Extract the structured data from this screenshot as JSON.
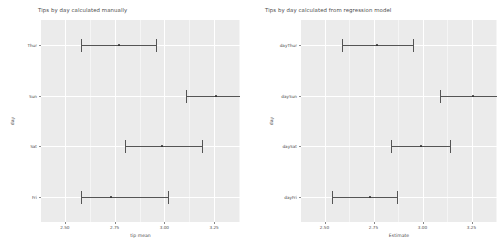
{
  "chart_data": [
    {
      "type": "scatter",
      "id": "manual",
      "title": "Tips by day calculated manually",
      "xlabel": "tip mean",
      "ylabel": "day",
      "grid": true,
      "legend": false,
      "xlim": [
        2.38,
        3.38
      ],
      "xticks": [
        2.5,
        2.75,
        3.0,
        3.25
      ],
      "xticklabels": [
        "2.50",
        "2.75",
        "3.00",
        "3.25"
      ],
      "categories": [
        "Thur",
        "Sun",
        "Sat",
        "Fri"
      ],
      "points": [
        {
          "category": "Thur",
          "estimate": 2.77,
          "low": 2.58,
          "high": 2.96
        },
        {
          "category": "Sun",
          "estimate": 3.26,
          "low": 3.11,
          "high": 3.41
        },
        {
          "category": "Sat",
          "estimate": 2.99,
          "low": 2.8,
          "high": 3.19
        },
        {
          "category": "Fri",
          "estimate": 2.73,
          "low": 2.58,
          "high": 3.02
        }
      ]
    },
    {
      "type": "scatter",
      "id": "regression",
      "title": "Tips by day calculated from regression model",
      "xlabel": "Estimate",
      "ylabel": "day",
      "grid": true,
      "legend": false,
      "xlim": [
        2.38,
        3.38
      ],
      "xticks": [
        2.5,
        2.75,
        3.0,
        3.25,
        3.5
      ],
      "xticklabels": [
        "2.50",
        "2.75",
        "3.00",
        "3.25",
        "3.50"
      ],
      "categories": [
        "dayThur",
        "daySun",
        "daySat",
        "dayFri"
      ],
      "points": [
        {
          "category": "dayThur",
          "estimate": 2.77,
          "low": 2.59,
          "high": 2.95
        },
        {
          "category": "daySun",
          "estimate": 3.26,
          "low": 3.09,
          "high": 3.43
        },
        {
          "category": "daySat",
          "estimate": 2.99,
          "low": 2.84,
          "high": 3.14
        },
        {
          "category": "dayFri",
          "estimate": 2.73,
          "low": 2.54,
          "high": 2.87
        }
      ]
    }
  ],
  "style": {
    "panel_background": "#ebebeb",
    "gridline_color": "#ffffff",
    "errorbar_color": "#555555",
    "point_color": "#2b2b2b",
    "text_color": "#4d4d4d"
  }
}
